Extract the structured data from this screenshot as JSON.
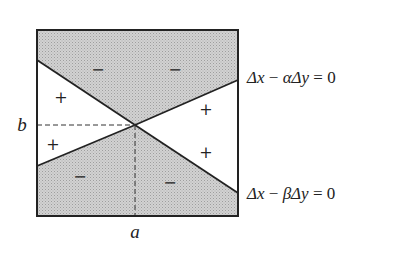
{
  "diagram": {
    "type": "sign-regions",
    "axis_labels": {
      "x_point": "a",
      "y_point": "b"
    },
    "lines": [
      {
        "id": "alpha-line",
        "equation_parts": [
          "Δx",
          " − ",
          "α",
          "Δy",
          " = 0"
        ]
      },
      {
        "id": "beta-line",
        "equation_parts": [
          "Δx",
          " − ",
          "β",
          "Δy",
          " = 0"
        ]
      }
    ],
    "regions": {
      "top": {
        "signs": [
          "−",
          "−"
        ],
        "shaded": true
      },
      "left": {
        "signs": [
          "+",
          "+"
        ],
        "shaded": false
      },
      "right": {
        "signs": [
          "+",
          "+"
        ],
        "shaded": false
      },
      "bottom": {
        "signs": [
          "−",
          "−"
        ],
        "shaded": true
      }
    },
    "colors": {
      "shade": "#c9c9c9",
      "stroke": "#222222",
      "background": "#ffffff"
    }
  }
}
